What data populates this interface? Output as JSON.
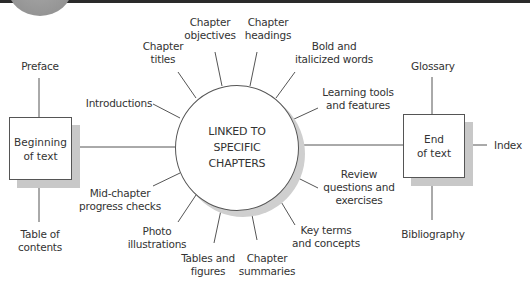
{
  "diagram": {
    "hub": {
      "lines": [
        "LINKED TO",
        "SPECIFIC",
        "CHAPTERS"
      ]
    },
    "left_box": {
      "lines": [
        "Beginning",
        "of text"
      ]
    },
    "right_box": {
      "lines": [
        "End",
        "of text"
      ]
    },
    "left_box_items": {
      "top": {
        "lines": [
          "Preface"
        ]
      },
      "bottom": {
        "lines": [
          "Table of",
          "contents"
        ]
      }
    },
    "right_box_items": {
      "top": {
        "lines": [
          "Glossary"
        ]
      },
      "right": {
        "lines": [
          "Index"
        ]
      },
      "bottom": {
        "lines": [
          "Bibliography"
        ]
      }
    },
    "hub_spokes": [
      {
        "lines": [
          "Introductions"
        ]
      },
      {
        "lines": [
          "Chapter",
          "titles"
        ]
      },
      {
        "lines": [
          "Chapter",
          "objectives"
        ]
      },
      {
        "lines": [
          "Chapter",
          "headings"
        ]
      },
      {
        "lines": [
          "Bold and",
          "italicized words"
        ]
      },
      {
        "lines": [
          "Learning tools",
          "and features"
        ]
      },
      {
        "lines": [
          "Review",
          "questions and",
          "exercises"
        ]
      },
      {
        "lines": [
          "Key terms",
          "and concepts"
        ]
      },
      {
        "lines": [
          "Chapter",
          "summaries"
        ]
      },
      {
        "lines": [
          "Tables and",
          "figures"
        ]
      },
      {
        "lines": [
          "Photo",
          "illustrations"
        ]
      },
      {
        "lines": [
          "Mid-chapter",
          "progress checks"
        ]
      }
    ],
    "colors": {
      "line": "#555555",
      "shadow": "#c8c8c8",
      "topbar": "#2a2a2a"
    }
  }
}
